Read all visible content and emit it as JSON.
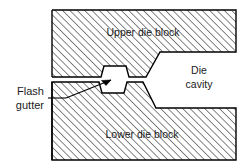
{
  "figure": {
    "type": "engineering-cross-section",
    "colors": {
      "outline": "#000000",
      "hatch": "#3d3d3d",
      "text": "#1a1a1a",
      "background": "#ffffff",
      "cavity_fill": "#ffffff"
    }
  },
  "labels": {
    "upper_die_block": "Upper die block",
    "lower_die_block": "Lower die block",
    "die_cavity_line1": "Die",
    "die_cavity_line2": "cavity",
    "flash_gutter_line1": "Flash",
    "flash_gutter_line2": "gutter"
  },
  "regions": {
    "upper_die": {
      "name": "Upper die block",
      "hatched": true,
      "position": "top"
    },
    "lower_die": {
      "name": "Lower die block",
      "hatched": true,
      "position": "bottom"
    },
    "die_cavity": {
      "name": "Die cavity",
      "hatched": false,
      "position": "right"
    },
    "flash_gutter": {
      "name": "Flash gutter",
      "hatched": false,
      "position": "center-left"
    }
  },
  "annotations": {
    "leader": {
      "name": "flash-gutter-leader",
      "has_arrowhead": true,
      "points_to": "flash gutter pocket"
    }
  }
}
